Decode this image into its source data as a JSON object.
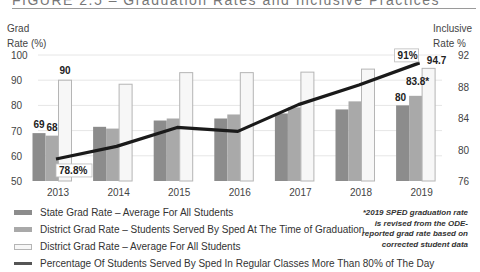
{
  "header": {
    "title": "FIGURE 2.5 – Graduation Rates and Inclusive Practices"
  },
  "axes": {
    "left_title_line1": "Grad",
    "left_title_line2": "Rate (%)",
    "right_title_line1": "Inclusive",
    "right_title_line2": "Rate %"
  },
  "colors": {
    "state": "#8c8c8c",
    "district_sped": "#a9a9a9",
    "district_all": "#f7f7f7",
    "district_all_border": "#b5b5b5",
    "line": "#1a1a1a",
    "grid": "#e6e6e6"
  },
  "legend": [
    {
      "label": "State Grad Rate – Average For All Students",
      "type": "bar",
      "key": "state"
    },
    {
      "label": "District Grad Rate – Students Served By Sped At The Time of Graduation",
      "type": "bar",
      "key": "district_sped"
    },
    {
      "label": "District Grad Rate – Average For All Students",
      "type": "bar",
      "key": "district_all"
    },
    {
      "label": "Percentage Of Students Served By Sped In Regular Classes More Than 80% of The Day",
      "type": "line",
      "key": "line"
    }
  ],
  "footnote": "*2019 SPED graduation rate is revised from the ODE-reported grad rate based on corrected student data",
  "chart_data": {
    "type": "bar",
    "title": "FIGURE 2.5 – Graduation Rates and Inclusive Practices",
    "xlabel": "",
    "ylabel": "Grad Rate (%)",
    "y2label": "Inclusive Rate %",
    "categories": [
      "2013",
      "2014",
      "2015",
      "2016",
      "2017",
      "2018",
      "2019"
    ],
    "ylim": [
      50,
      100
    ],
    "yticks": [
      50,
      60,
      70,
      80,
      90,
      100
    ],
    "y2lim": [
      76,
      92
    ],
    "y2ticks": [
      76,
      80,
      84,
      88,
      92
    ],
    "grid": true,
    "legend_position": "bottom-left",
    "series": [
      {
        "name": "State Grad Rate – Average For All Students",
        "type": "bar",
        "axis": "left",
        "values": [
          69,
          71.5,
          74,
          74.8,
          76.8,
          78.4,
          80
        ]
      },
      {
        "name": "District Grad Rate – Students Served By Sped At The Time of Graduation",
        "type": "bar",
        "axis": "left",
        "values": [
          68,
          70.8,
          74.8,
          76.4,
          79.2,
          81.6,
          83.8
        ]
      },
      {
        "name": "District Grad Rate – Average For All Students",
        "type": "bar",
        "axis": "left",
        "values": [
          90,
          88.4,
          93,
          93,
          93.2,
          94.4,
          94.7
        ]
      },
      {
        "name": "Percentage Of Students Served By Sped In Regular Classes More Than 80% of The Day",
        "type": "line",
        "axis": "right",
        "values": [
          78.8,
          80.4,
          82.8,
          82.3,
          85.7,
          88.2,
          91
        ]
      }
    ],
    "annotations": [
      {
        "category": "2013",
        "series": 0,
        "text": "69"
      },
      {
        "category": "2013",
        "series": 1,
        "text": "68"
      },
      {
        "category": "2013",
        "series": 2,
        "text": "90"
      },
      {
        "category": "2013",
        "series": 3,
        "text": "78.8%",
        "boxed": true
      },
      {
        "category": "2019",
        "series": 0,
        "text": "80"
      },
      {
        "category": "2019",
        "series": 1,
        "text": "83.8*"
      },
      {
        "category": "2019",
        "series": 2,
        "text": "94.7"
      },
      {
        "category": "2019",
        "series": 3,
        "text": "91%",
        "boxed": true
      }
    ]
  }
}
